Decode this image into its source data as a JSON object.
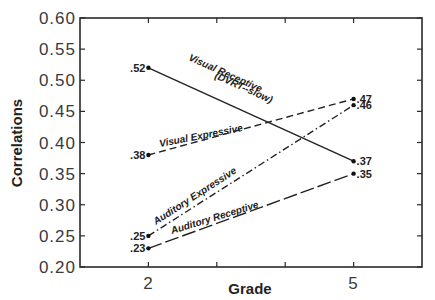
{
  "chart_data": {
    "type": "line",
    "title": "",
    "xlabel": "Grade",
    "ylabel": "Correlations",
    "x": [
      2,
      5
    ],
    "xlim": [
      1,
      6
    ],
    "ylim": [
      0.2,
      0.6
    ],
    "x_ticks": [
      2,
      3,
      4,
      5
    ],
    "x_tick_labels": [
      "2",
      "5"
    ],
    "y_ticks": [
      0.2,
      0.25,
      0.3,
      0.35,
      0.4,
      0.45,
      0.5,
      0.55,
      0.6
    ],
    "y_tick_labels": [
      "0.20",
      "0.25",
      "0.30",
      "0.35",
      "0.40",
      "0.45",
      "0.50",
      "0.55",
      "0.60"
    ],
    "grid": false,
    "legend": "inline labels on lines",
    "series": [
      {
        "name": "Visual Receptive",
        "sub_name": "(DVRT--slow)",
        "style": "solid",
        "values": [
          0.52,
          0.37
        ],
        "value_labels": [
          ".52",
          ".37"
        ]
      },
      {
        "name": "Visual Expressive",
        "style": "dashed",
        "values": [
          0.38,
          0.47
        ],
        "value_labels": [
          ".38",
          ".47"
        ]
      },
      {
        "name": "Auditory Expressive",
        "style": "dash-dot",
        "values": [
          0.25,
          0.46
        ],
        "value_labels": [
          ".25",
          ".46"
        ]
      },
      {
        "name": "Auditory Receptive",
        "style": "long-dash",
        "values": [
          0.23,
          0.35
        ],
        "value_labels": [
          ".23",
          ".35"
        ]
      }
    ]
  }
}
